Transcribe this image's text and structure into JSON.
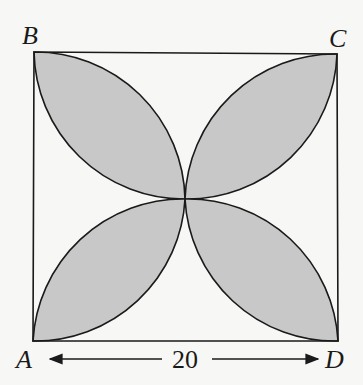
{
  "figure": {
    "vertices": {
      "A": "A",
      "B": "B",
      "C": "C",
      "D": "D"
    },
    "dimension_label": "20",
    "colors": {
      "petal_fill": "#c8c8c8",
      "stroke": "#1a1a1a",
      "background": "#f7f7f5"
    }
  }
}
